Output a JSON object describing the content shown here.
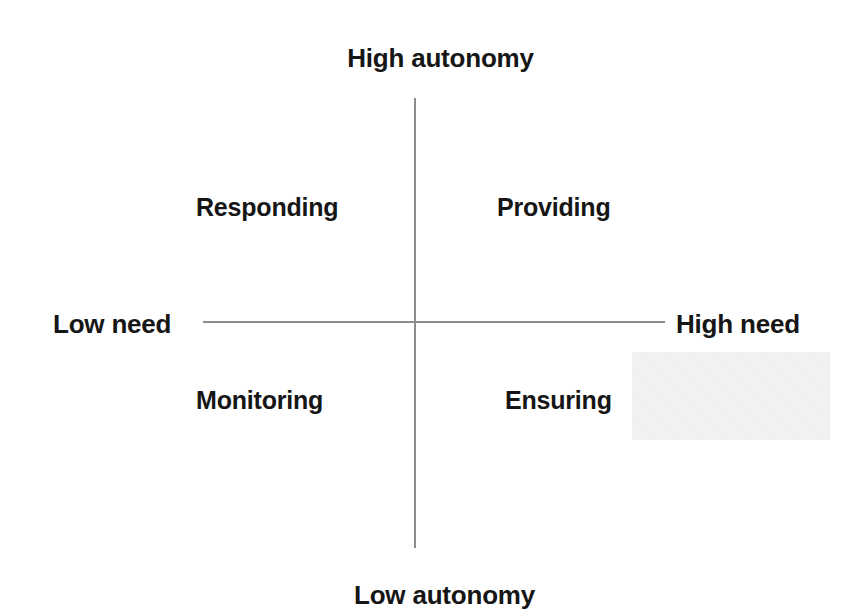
{
  "diagram": {
    "type": "2x2-quadrant-matrix",
    "axes": {
      "vertical": {
        "name": "autonomy",
        "top_label": "High autonomy",
        "bottom_label": "Low autonomy",
        "line_color": "#8d8d8d"
      },
      "horizontal": {
        "name": "need",
        "left_label": "Low need",
        "right_label": "High need",
        "line_color": "#8d8d8d"
      }
    },
    "quadrants": [
      {
        "id": "top-left",
        "label": "Responding",
        "autonomy": "High autonomy",
        "need": "Low need"
      },
      {
        "id": "top-right",
        "label": "Providing",
        "autonomy": "High autonomy",
        "need": "High need"
      },
      {
        "id": "bottom-left",
        "label": "Monitoring",
        "autonomy": "Low autonomy",
        "need": "Low need"
      },
      {
        "id": "bottom-right",
        "label": "Ensuring",
        "autonomy": "Low autonomy",
        "need": "High need"
      }
    ],
    "shade_box": {
      "label": "",
      "color": "#e9e9e9"
    },
    "background_color": "#ffffff",
    "text_color": "#161616"
  },
  "chart_data": {
    "type": "scatter",
    "title": "",
    "xlabel": "need",
    "ylabel": "autonomy",
    "grid": false,
    "legend": "none",
    "x_axis_ticks": [
      "Low need",
      "High need"
    ],
    "y_axis_ticks": [
      "Low autonomy",
      "High autonomy"
    ],
    "annotations": [
      "Responding",
      "Providing",
      "Monitoring",
      "Ensuring"
    ]
  }
}
